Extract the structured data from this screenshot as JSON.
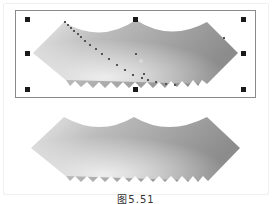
{
  "figure": {
    "caption": "图5.51",
    "top_panel": {
      "label": "selected envelope-distorted gradient shape",
      "selected": true,
      "handles": 8
    },
    "bottom_panel": {
      "label": "result envelope-distorted gradient shape",
      "selected": false
    }
  },
  "colors": {
    "gradient_light": "#e6e6e6",
    "gradient_dark": "#8c8c8c",
    "selection_border": "#8a8a8a",
    "handle": "#1a1a1a",
    "node": "#555555"
  }
}
